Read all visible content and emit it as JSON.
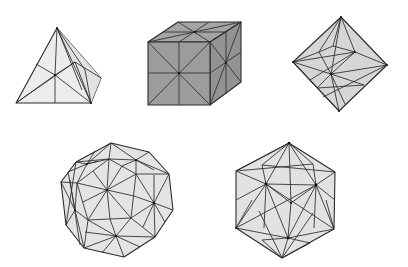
{
  "figure": {
    "solids": [
      {
        "name": "tetrahedron",
        "fill": "#ececec"
      },
      {
        "name": "cube",
        "fill": "#9c9c9c",
        "top_fill": "#a6a6a6",
        "side_fill": "#929292"
      },
      {
        "name": "octahedron",
        "fill": "#d6d6d6"
      },
      {
        "name": "dodecahedron",
        "fill": "#e4e4e4"
      },
      {
        "name": "icosahedron",
        "fill": "#e2e2e2"
      }
    ]
  },
  "colors": {
    "background": "#ffffff",
    "edge": "#333333"
  }
}
